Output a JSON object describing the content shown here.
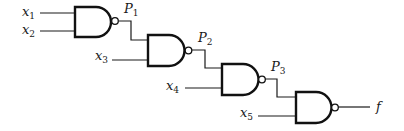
{
  "diagram": {
    "type": "logic-circuit",
    "gate_type": "NAND",
    "gates": [
      {
        "id": "g1",
        "inputs": [
          "x1",
          "x2"
        ],
        "output": "P1"
      },
      {
        "id": "g2",
        "inputs": [
          "P1",
          "x3"
        ],
        "output": "P2"
      },
      {
        "id": "g3",
        "inputs": [
          "P2",
          "x4"
        ],
        "output": "P3"
      },
      {
        "id": "g4",
        "inputs": [
          "P3",
          "x5"
        ],
        "output": "f"
      }
    ],
    "labels": {
      "x1": {
        "base": "x",
        "sub": "1"
      },
      "x2": {
        "base": "x",
        "sub": "2"
      },
      "x3": {
        "base": "x",
        "sub": "3"
      },
      "x4": {
        "base": "x",
        "sub": "4"
      },
      "x5": {
        "base": "x",
        "sub": "5"
      },
      "P1": {
        "base": "P",
        "sub": "1"
      },
      "P2": {
        "base": "P",
        "sub": "2"
      },
      "P3": {
        "base": "P",
        "sub": "3"
      },
      "f": {
        "base": "f"
      }
    },
    "colors": {
      "stroke": "#111111",
      "background": "#ffffff"
    }
  }
}
